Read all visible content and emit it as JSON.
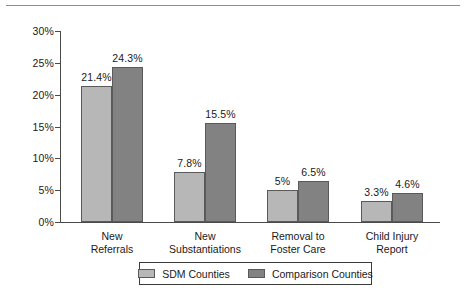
{
  "chart_data": {
    "type": "bar",
    "title": "",
    "subtitle": "",
    "xlabel": "",
    "ylabel": "",
    "ylim": [
      0,
      30
    ],
    "yticks": [
      "0%",
      "5%",
      "10%",
      "15%",
      "20%",
      "25%",
      "30%"
    ],
    "ytick_values": [
      0,
      5,
      10,
      15,
      20,
      25,
      30
    ],
    "grid": false,
    "legend_position": "bottom-center",
    "categories": [
      "New Referrals",
      "New Substantiations",
      "Removal to Foster Care",
      "Child Injury Report"
    ],
    "category_lines": [
      [
        "New",
        "Referrals"
      ],
      [
        "New",
        "Substantiations"
      ],
      [
        "Removal to",
        "Foster Care"
      ],
      [
        "Child Injury",
        "Report"
      ]
    ],
    "series": [
      {
        "name": "SDM Counties",
        "color": "#b7b7b7",
        "values": [
          21.4,
          7.8,
          5.0,
          3.3
        ],
        "labels": [
          "21.4%",
          "7.8%",
          "5%",
          "3.3%"
        ]
      },
      {
        "name": "Comparison Counties",
        "color": "#828282",
        "values": [
          24.3,
          15.5,
          6.5,
          4.6
        ],
        "labels": [
          "24.3%",
          "15.5%",
          "6.5%",
          "4.6%"
        ]
      }
    ]
  },
  "legend": {
    "entries": [
      {
        "label": "SDM Counties",
        "color": "#b7b7b7"
      },
      {
        "label": "Comparison Counties",
        "color": "#828282"
      }
    ]
  },
  "colors": {
    "series_light": "#b7b7b7",
    "series_dark": "#828282",
    "axis": "#4a4a4a",
    "text": "#1a1a1a",
    "rule": "#8d8d8d",
    "background": "#ffffff"
  }
}
